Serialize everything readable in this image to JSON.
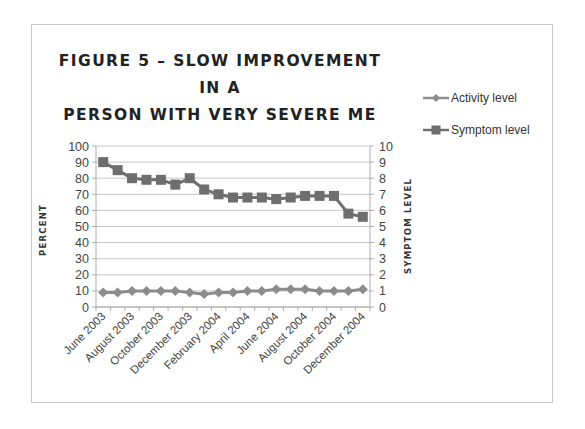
{
  "chart_data": {
    "type": "line",
    "title": "FIGURE 5 – SLOW IMPROVEMENT IN A PERSON WITH VERY SEVERE ME",
    "title_lines": [
      "FIGURE 5 – SLOW IMPROVEMENT IN A",
      "PERSON WITH VERY SEVERE ME"
    ],
    "xlabel": "",
    "ylabel": "PERCENT",
    "ylabel_right": "SYMPTOM LEVEL",
    "ylim": [
      0,
      100
    ],
    "ylim_right": [
      0,
      10
    ],
    "yticks": [
      0,
      10,
      20,
      30,
      40,
      50,
      60,
      70,
      80,
      90,
      100
    ],
    "yticks_right": [
      0,
      1,
      2,
      3,
      4,
      5,
      6,
      7,
      8,
      9,
      10
    ],
    "grid": true,
    "legend_position": "right",
    "x": [
      "June 2003",
      "July 2003",
      "August 2003",
      "September 2003",
      "October 2003",
      "November 2003",
      "December 2003",
      "January 2004",
      "February 2004",
      "March 2004",
      "April 2004",
      "May 2004",
      "June 2004",
      "July 2004",
      "August 2004",
      "September 2004",
      "October 2004",
      "November 2004",
      "December 2004"
    ],
    "x_tick_labels": [
      "June 2003",
      "August 2003",
      "October 2003",
      "December 2003",
      "February 2004",
      "April 2004",
      "June 2004",
      "August 2004",
      "October 2004",
      "December 2004"
    ],
    "series": [
      {
        "name": "Activity level",
        "axis": "left",
        "marker": "diamond",
        "color": "#8c8c8c",
        "values": [
          9,
          9,
          10,
          10,
          10,
          10,
          9,
          8,
          9,
          9,
          10,
          10,
          11,
          11,
          11,
          10,
          10,
          10,
          11
        ]
      },
      {
        "name": "Symptom level",
        "axis": "left",
        "marker": "square",
        "color": "#6e6e6e",
        "values": [
          90,
          85,
          80,
          79,
          79,
          76,
          80,
          73,
          70,
          68,
          68,
          68,
          67,
          68,
          69,
          69,
          69,
          58,
          56
        ]
      }
    ]
  },
  "legend": {
    "items": [
      {
        "label": "Activity level"
      },
      {
        "label": "Symptom level"
      }
    ]
  }
}
